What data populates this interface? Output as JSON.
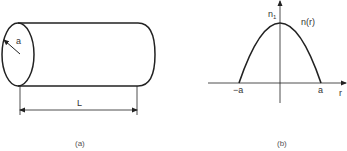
{
  "figure_a": {
    "caption": "(a)",
    "radius_label": "a",
    "length_label": "L",
    "shape": "cylinder"
  },
  "figure_b": {
    "caption": "(b)",
    "peak_label": "n",
    "peak_subscript": "1",
    "curve_label": "n(r)",
    "x_axis_label": "r",
    "x_ticks": [
      "−a",
      "a"
    ],
    "curve": "parabola"
  },
  "colors": {
    "line": "#222222",
    "text": "#333333",
    "background": "#ffffff"
  }
}
